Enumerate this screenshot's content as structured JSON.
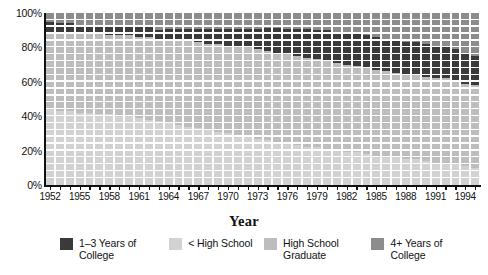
{
  "chart_data": {
    "type": "bar",
    "subtype": "100% stacked bar",
    "title": "",
    "xlabel": "Year",
    "ylabel": "",
    "ylim": [
      0,
      100
    ],
    "yticks": [
      0,
      20,
      40,
      60,
      80,
      100
    ],
    "ytick_labels": [
      "0%",
      "20%",
      "40%",
      "60%",
      "80%",
      "100%"
    ],
    "grid": "horizontal white gridlines over bars",
    "legend_position": "bottom",
    "legend": [
      {
        "name": "1–3  Years of\nCollege",
        "color": "#3a3a3a"
      },
      {
        "name": "< High School",
        "color": "#d2d2d2"
      },
      {
        "name": "High School\nGraduate",
        "color": "#bdbdbd"
      },
      {
        "name": "4+ Years of\nCollege",
        "color": "#8c8c8c"
      }
    ],
    "stack_order_bottom_to_top": [
      "< High School",
      "High School Graduate",
      "1–3  Years of College",
      "4+ Years of College"
    ],
    "x": [
      1952,
      1953,
      1954,
      1955,
      1956,
      1957,
      1958,
      1959,
      1960,
      1961,
      1962,
      1963,
      1964,
      1965,
      1966,
      1967,
      1968,
      1969,
      1970,
      1971,
      1972,
      1973,
      1974,
      1975,
      1976,
      1977,
      1978,
      1979,
      1980,
      1981,
      1982,
      1983,
      1984,
      1985,
      1986,
      1987,
      1988,
      1989,
      1990,
      1991,
      1992,
      1993,
      1994,
      1995
    ],
    "xtick_labels": [
      "1952",
      "1955",
      "1958",
      "1961",
      "1964",
      "1967",
      "1970",
      "1973",
      "1976",
      "1979",
      "1982",
      "1985",
      "1988",
      "1991",
      "1994"
    ],
    "series": [
      {
        "name": "< High School",
        "color": "#d2d2d2",
        "values": [
          44,
          43,
          43,
          42,
          42,
          41,
          41,
          40,
          40,
          39,
          38,
          37,
          36,
          35,
          34,
          33,
          32,
          31,
          30,
          29,
          28,
          27,
          26,
          25,
          24,
          23,
          22,
          22,
          21,
          20,
          19,
          19,
          18,
          17,
          16,
          16,
          15,
          15,
          14,
          13,
          13,
          12,
          11,
          10
        ]
      },
      {
        "name": "High School Graduate",
        "color": "#bdbdbd",
        "values": [
          45,
          46,
          46,
          46,
          46,
          47,
          46,
          47,
          47,
          47,
          48,
          48,
          49,
          49,
          50,
          50,
          50,
          51,
          51,
          51,
          52,
          52,
          52,
          52,
          52,
          52,
          52,
          51,
          51,
          51,
          51,
          50,
          50,
          50,
          50,
          49,
          49,
          49,
          49,
          49,
          49,
          49,
          48,
          48
        ]
      },
      {
        "name": "1–3  Years of College",
        "color": "#3a3a3a",
        "values": [
          6,
          5,
          5,
          5,
          5,
          5,
          6,
          5,
          5,
          6,
          6,
          5,
          6,
          7,
          7,
          8,
          9,
          9,
          10,
          11,
          11,
          12,
          13,
          14,
          15,
          16,
          17,
          17,
          18,
          18,
          19,
          19,
          19,
          19,
          19,
          19,
          19,
          19,
          19,
          18,
          18,
          18,
          18,
          17
        ]
      },
      {
        "name": "4+ Years of College",
        "color": "#8c8c8c",
        "values": [
          5,
          6,
          6,
          7,
          7,
          7,
          7,
          8,
          8,
          8,
          8,
          10,
          9,
          9,
          9,
          9,
          9,
          9,
          9,
          9,
          9,
          9,
          9,
          9,
          9,
          9,
          9,
          10,
          10,
          11,
          11,
          12,
          13,
          14,
          15,
          16,
          17,
          17,
          18,
          20,
          20,
          21,
          23,
          25
        ]
      }
    ]
  },
  "axis": {
    "x_title": "Year"
  }
}
